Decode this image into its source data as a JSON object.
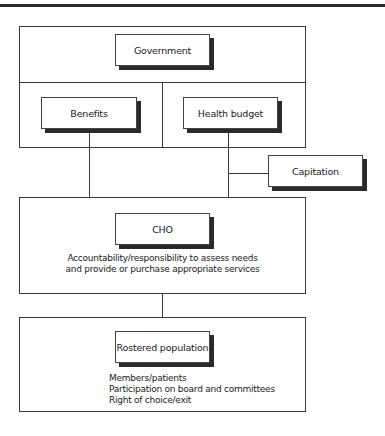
{
  "diagram": {
    "government_section": {
      "title": "Government",
      "children": [
        {
          "label": "Benefits"
        },
        {
          "label": "Health budget"
        }
      ]
    },
    "capitation": {
      "label": "Capitation"
    },
    "cho_section": {
      "title": "CHO",
      "description": [
        "Accountability/responsibility to assess needs",
        "and provide or purchase appropriate services"
      ]
    },
    "rostered_section": {
      "title": "Rostered population",
      "description": [
        "Members/patients",
        "Participation on board and committees",
        "Right of choice/exit"
      ]
    }
  },
  "colors": {
    "line": "#3a3a3a",
    "shadow": "#2a2a2a",
    "background": "#ffffff"
  }
}
